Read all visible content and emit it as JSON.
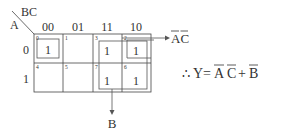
{
  "kmap": {
    "row_var": "A",
    "col_var": "BC",
    "col_headers": [
      "00",
      "01",
      "11",
      "10"
    ],
    "row_headers": [
      "0",
      "1"
    ],
    "cells": [
      [
        {
          "index": "0",
          "value": "1"
        },
        {
          "index": "1",
          "value": ""
        },
        {
          "index": "3",
          "value": "1"
        },
        {
          "index": "2",
          "value": "1"
        }
      ],
      [
        {
          "index": "4",
          "value": ""
        },
        {
          "index": "5",
          "value": ""
        },
        {
          "index": "7",
          "value": "1"
        },
        {
          "index": "6",
          "value": "1"
        }
      ]
    ],
    "groups": [
      {
        "name": "A'C' group",
        "label": "AC",
        "overbar": "both"
      },
      {
        "name": "B group",
        "label": "B"
      }
    ]
  },
  "equation": {
    "therefore": "∴",
    "lhs": "Y",
    "eq": "=",
    "term1_a": "A",
    "term1_c": "C",
    "plus": "+",
    "term2": "B"
  },
  "colors": {
    "line": "#444444",
    "text": "#333333",
    "background": "#ffffff"
  }
}
